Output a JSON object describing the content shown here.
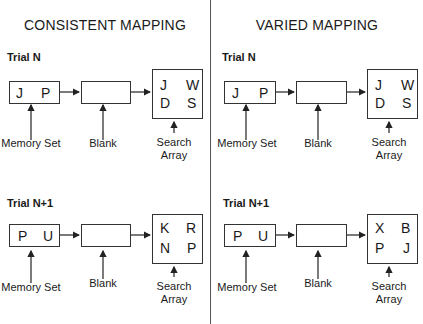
{
  "panels": [
    {
      "heading": "CONSISTENT MAPPING",
      "trials": [
        {
          "label": "Trial N",
          "memory_set": [
            "J",
            "P"
          ],
          "search_array": [
            "J",
            "W",
            "D",
            "S"
          ]
        },
        {
          "label": "Trial N+1",
          "memory_set": [
            "P",
            "U"
          ],
          "search_array": [
            "K",
            "R",
            "N",
            "P"
          ]
        }
      ]
    },
    {
      "heading": "VARIED MAPPING",
      "trials": [
        {
          "label": "Trial N",
          "memory_set": [
            "J",
            "P"
          ],
          "search_array": [
            "J",
            "W",
            "D",
            "S"
          ]
        },
        {
          "label": "Trial N+1",
          "memory_set": [
            "P",
            "U"
          ],
          "search_array": [
            "X",
            "B",
            "P",
            "J"
          ]
        }
      ]
    }
  ],
  "labels": {
    "memory_set": "Memory Set",
    "blank": "Blank",
    "search_line1": "Search",
    "search_line2": "Array"
  }
}
